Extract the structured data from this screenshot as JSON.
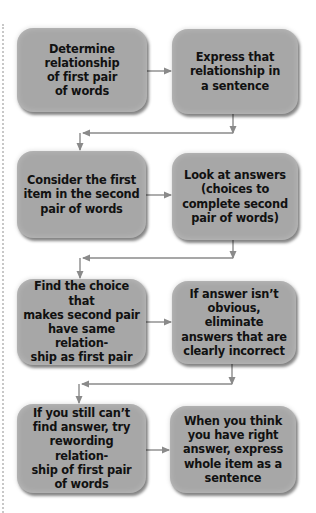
{
  "diagram": {
    "type": "flowchart",
    "colors": {
      "box_fill": "#a7a7a7",
      "arrow": "#8a8a8a",
      "text": "#111111"
    },
    "steps": [
      {
        "id": 1,
        "label": "Determine\nrelationship\nof first pair\nof words"
      },
      {
        "id": 2,
        "label": "Express that\nrelationship in\na sentence"
      },
      {
        "id": 3,
        "label": "Consider the first\nitem in the second\npair of words"
      },
      {
        "id": 4,
        "label": "Look at answers\n(choices to\ncomplete second\npair of words)"
      },
      {
        "id": 5,
        "label": "Find the choice that\nmakes second pair\nhave same relation-\nship as first pair"
      },
      {
        "id": 6,
        "label": "If answer isn’t\nobvious, eliminate\nanswers that are\nclearly incorrect"
      },
      {
        "id": 7,
        "label": "If you still can’t\nfind answer, try\nrewording relation-\nship of first pair\nof words"
      },
      {
        "id": 8,
        "label": "When you think\nyou have right\nanswer, express\nwhole item as a\nsentence"
      }
    ],
    "edges": [
      {
        "from": 1,
        "to": 2
      },
      {
        "from": 2,
        "to": 3
      },
      {
        "from": 3,
        "to": 4
      },
      {
        "from": 4,
        "to": 5
      },
      {
        "from": 5,
        "to": 6
      },
      {
        "from": 6,
        "to": 7
      },
      {
        "from": 7,
        "to": 8
      }
    ]
  }
}
